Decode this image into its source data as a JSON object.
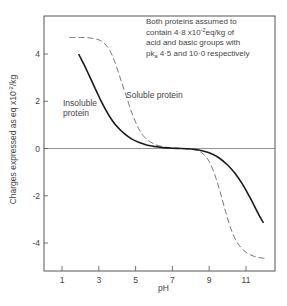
{
  "chart_data": {
    "type": "line",
    "title": "",
    "xlabel": "pH",
    "ylabel": "Charges expressed as eq x10^-2/kg",
    "ylabel_parts": {
      "main": "Charges expressed as eq x10",
      "sup": "-2",
      "tail": "/kg"
    },
    "xlim": [
      -0.0,
      12.6
    ],
    "ylim": [
      -5.25,
      5.6
    ],
    "xticks": [
      1,
      3,
      5,
      7,
      9,
      11
    ],
    "xtick_labels": [
      "1",
      "3",
      "5",
      "7",
      "9",
      "11"
    ],
    "yticks": [
      4,
      2,
      0,
      -2,
      -4
    ],
    "ytick_labels": [
      "4",
      "2",
      "0",
      "-2",
      "-4"
    ],
    "grid": false,
    "zero_line": true,
    "legend": "inline labels",
    "annotation": {
      "lines": [
        "Both proteins assumed to",
        "contain 4·8 x10",
        "acid and basic groups with",
        "pk",
        " 4·5 and 10·0 respectively"
      ],
      "line2_sup": "-2",
      "line2_tail": "eq/kg of",
      "line4_sub": "a"
    },
    "series": [
      {
        "name": "Soluble protein",
        "label": "Soluble protein",
        "style": "dashed",
        "x": [
          1.4,
          2.0,
          2.5,
          3.0,
          3.3,
          3.6,
          3.9,
          4.2,
          4.5,
          4.8,
          5.1,
          5.4,
          5.8,
          6.2,
          6.6,
          7.0,
          7.5,
          8.0,
          8.4,
          8.7,
          9.0,
          9.3,
          9.6,
          9.9,
          10.2,
          10.5,
          10.8,
          11.1,
          11.4,
          11.7,
          12.0
        ],
        "values": [
          4.7,
          4.7,
          4.68,
          4.6,
          4.45,
          4.15,
          3.6,
          2.9,
          2.2,
          1.5,
          0.95,
          0.55,
          0.28,
          0.13,
          0.06,
          0.02,
          0.0,
          -0.03,
          -0.1,
          -0.25,
          -0.55,
          -1.1,
          -1.85,
          -2.7,
          -3.45,
          -3.95,
          -4.25,
          -4.45,
          -4.55,
          -4.62,
          -4.65
        ]
      },
      {
        "name": "Insoluble protein",
        "label": "Insoluble protein",
        "style": "solid",
        "x": [
          1.9,
          2.2,
          2.5,
          2.8,
          3.1,
          3.4,
          3.7,
          4.0,
          4.4,
          4.8,
          5.2,
          5.6,
          6.0,
          6.5,
          7.0,
          7.5,
          8.0,
          8.5,
          9.0,
          9.5,
          10.0,
          10.4,
          10.8,
          11.2,
          11.5,
          11.8,
          11.95
        ],
        "values": [
          4.0,
          3.55,
          3.05,
          2.55,
          2.05,
          1.6,
          1.22,
          0.92,
          0.62,
          0.4,
          0.25,
          0.15,
          0.09,
          0.04,
          0.01,
          0.0,
          -0.02,
          -0.07,
          -0.18,
          -0.38,
          -0.7,
          -1.05,
          -1.5,
          -2.05,
          -2.5,
          -2.95,
          -3.15
        ]
      }
    ]
  }
}
